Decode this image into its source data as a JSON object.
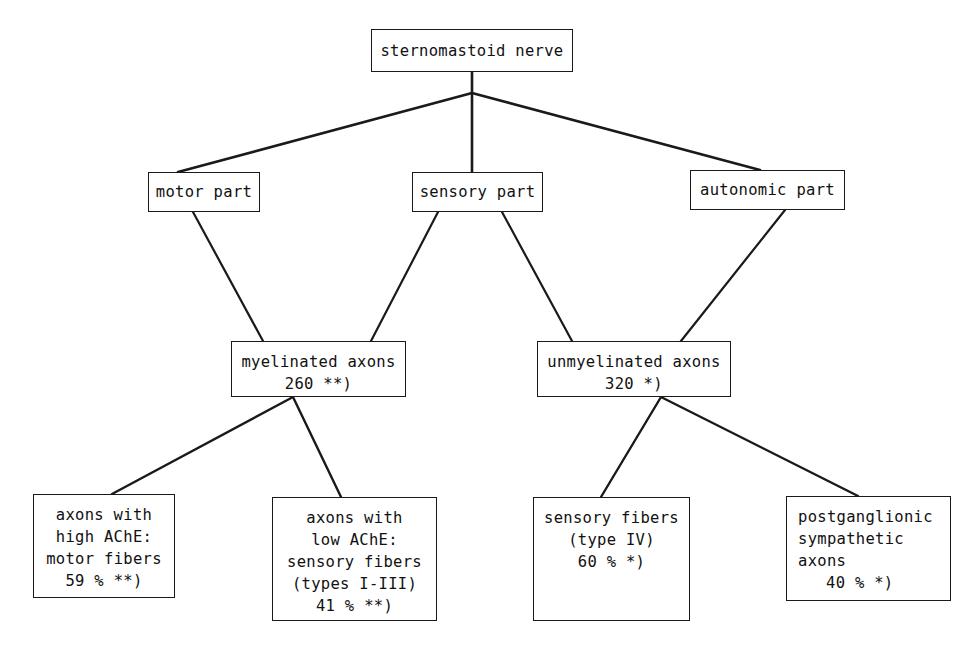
{
  "diagram": {
    "type": "hierarchy-tree",
    "stroke_color": "#1a1a1a",
    "text_color": "#111111",
    "background_color": "#ffffff",
    "nodes": {
      "root": {
        "label": "sternomastoid nerve",
        "lines": [
          "sternomastoid nerve"
        ]
      },
      "motor_part": {
        "label": "motor part",
        "lines": [
          "motor part"
        ]
      },
      "sensory_part": {
        "label": "sensory part",
        "lines": [
          "sensory part"
        ]
      },
      "autonomic_part": {
        "label": "autonomic part",
        "lines": [
          "autonomic part"
        ]
      },
      "myelinated": {
        "label": "myelinated axons",
        "lines": [
          "myelinated axons",
          "260 **)"
        ],
        "count": "260",
        "footnote_marker": "**)"
      },
      "unmyelinated": {
        "label": "unmyelinated axons",
        "lines": [
          "unmyelinated axons",
          "320 *)"
        ],
        "count": "320",
        "footnote_marker": "*)"
      },
      "high_ache": {
        "label": "axons with high AChE: motor fibers",
        "lines": [
          "axons with",
          "high AChE:",
          "motor fibers",
          "59 % **)"
        ],
        "percent": "59 %",
        "footnote_marker": "**)"
      },
      "low_ache": {
        "label": "axons with low AChE: sensory fibers",
        "lines": [
          "axons with",
          "low AChE:",
          "sensory fibers",
          "(types I-III)",
          "41 % **)"
        ],
        "percent": "41 %",
        "footnote_marker": "**)"
      },
      "sensory_fibers_iv": {
        "label": "sensory fibers (type IV)",
        "lines": [
          "sensory fibers",
          "(type IV)",
          "60 % *)"
        ],
        "percent": "60 %",
        "footnote_marker": "*)"
      },
      "postganglionic": {
        "label": "postganglionic sympathetic axons",
        "lines": [
          "postganglionic",
          "sympathetic",
          "axons",
          "40 % *)"
        ],
        "percent": "40 %",
        "footnote_marker": "*)"
      }
    },
    "edges": [
      {
        "from": "root",
        "to": "motor_part"
      },
      {
        "from": "root",
        "to": "sensory_part"
      },
      {
        "from": "root",
        "to": "autonomic_part"
      },
      {
        "from": "motor_part",
        "to": "myelinated"
      },
      {
        "from": "sensory_part",
        "to": "myelinated"
      },
      {
        "from": "sensory_part",
        "to": "unmyelinated"
      },
      {
        "from": "autonomic_part",
        "to": "unmyelinated"
      },
      {
        "from": "myelinated",
        "to": "high_ache"
      },
      {
        "from": "myelinated",
        "to": "low_ache"
      },
      {
        "from": "unmyelinated",
        "to": "sensory_fibers_iv"
      },
      {
        "from": "unmyelinated",
        "to": "postganglionic"
      }
    ]
  }
}
